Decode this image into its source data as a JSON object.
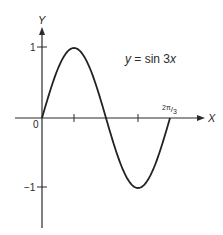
{
  "chart_data": {
    "type": "line",
    "title": "",
    "annotation": "y = sin 3x",
    "xlabel": "X",
    "ylabel": "Y",
    "function": "sin(3x)",
    "x_range": [
      0,
      2.0944
    ],
    "ylim": [
      -1,
      1
    ],
    "x_ticks": [
      {
        "value": 0.5236,
        "label": ""
      },
      {
        "value": 1.5708,
        "label": ""
      },
      {
        "value": 2.0944,
        "label": "2π/3"
      }
    ],
    "y_ticks": [
      {
        "value": 1,
        "label": "1"
      },
      {
        "value": -1,
        "label": "−1"
      }
    ],
    "origin_label": "0",
    "points": [
      {
        "x": 0,
        "y": 0
      },
      {
        "x": 0.5236,
        "y": 1
      },
      {
        "x": 1.0472,
        "y": 0
      },
      {
        "x": 1.5708,
        "y": -1
      },
      {
        "x": 2.0944,
        "y": 0
      }
    ],
    "grid": false,
    "legend": "none",
    "line_color": "#222222"
  },
  "labels": {
    "equation_y": "y",
    "equation_eq": " = sin 3",
    "equation_x": "x",
    "axis_x": "X",
    "axis_y": "Y",
    "origin": "0",
    "tick_y_pos": "1",
    "tick_y_neg": "−1",
    "tick_x_end_num": "2π",
    "tick_x_end_den": "3"
  }
}
